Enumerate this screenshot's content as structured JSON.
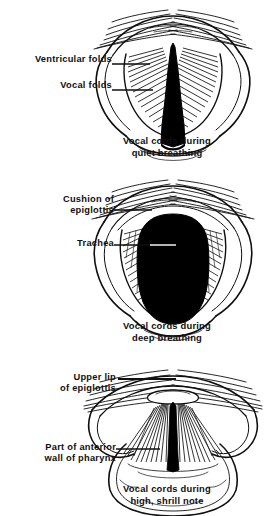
{
  "document": {
    "type": "anatomical-illustration",
    "subject": "Laryngoscopic views of the vocal cords",
    "background_color": "#ffffff",
    "ink_color": "#100f0f"
  },
  "panels": [
    {
      "id": "quiet",
      "caption": "Vocal cords during\nquiet breathing",
      "glottis_shape": "narrow triangular wedge",
      "labels": [
        {
          "name": "ventricular-folds",
          "text": "Ventricular folds"
        },
        {
          "name": "vocal-folds",
          "text": "Vocal  folds"
        }
      ]
    },
    {
      "id": "deep",
      "caption": "Vocal cords during\ndeep breathing",
      "glottis_shape": "wide oval barrel",
      "labels": [
        {
          "name": "cushion-of-epiglottis",
          "text": "Cushion  of\nepiglottis"
        },
        {
          "name": "trachea",
          "text": "Trachea"
        }
      ]
    },
    {
      "id": "shrill",
      "caption": "Vocal cords during\nhigh, shrill note",
      "glottis_shape": "narrow vertical slit",
      "labels": [
        {
          "name": "upper-lip-of-epiglottis",
          "text": "Upper lip\nof epiglottis"
        },
        {
          "name": "part-of-anterior-wall-of-pharynx",
          "text": "Part of anterior\nwall of pharynx"
        }
      ]
    }
  ]
}
